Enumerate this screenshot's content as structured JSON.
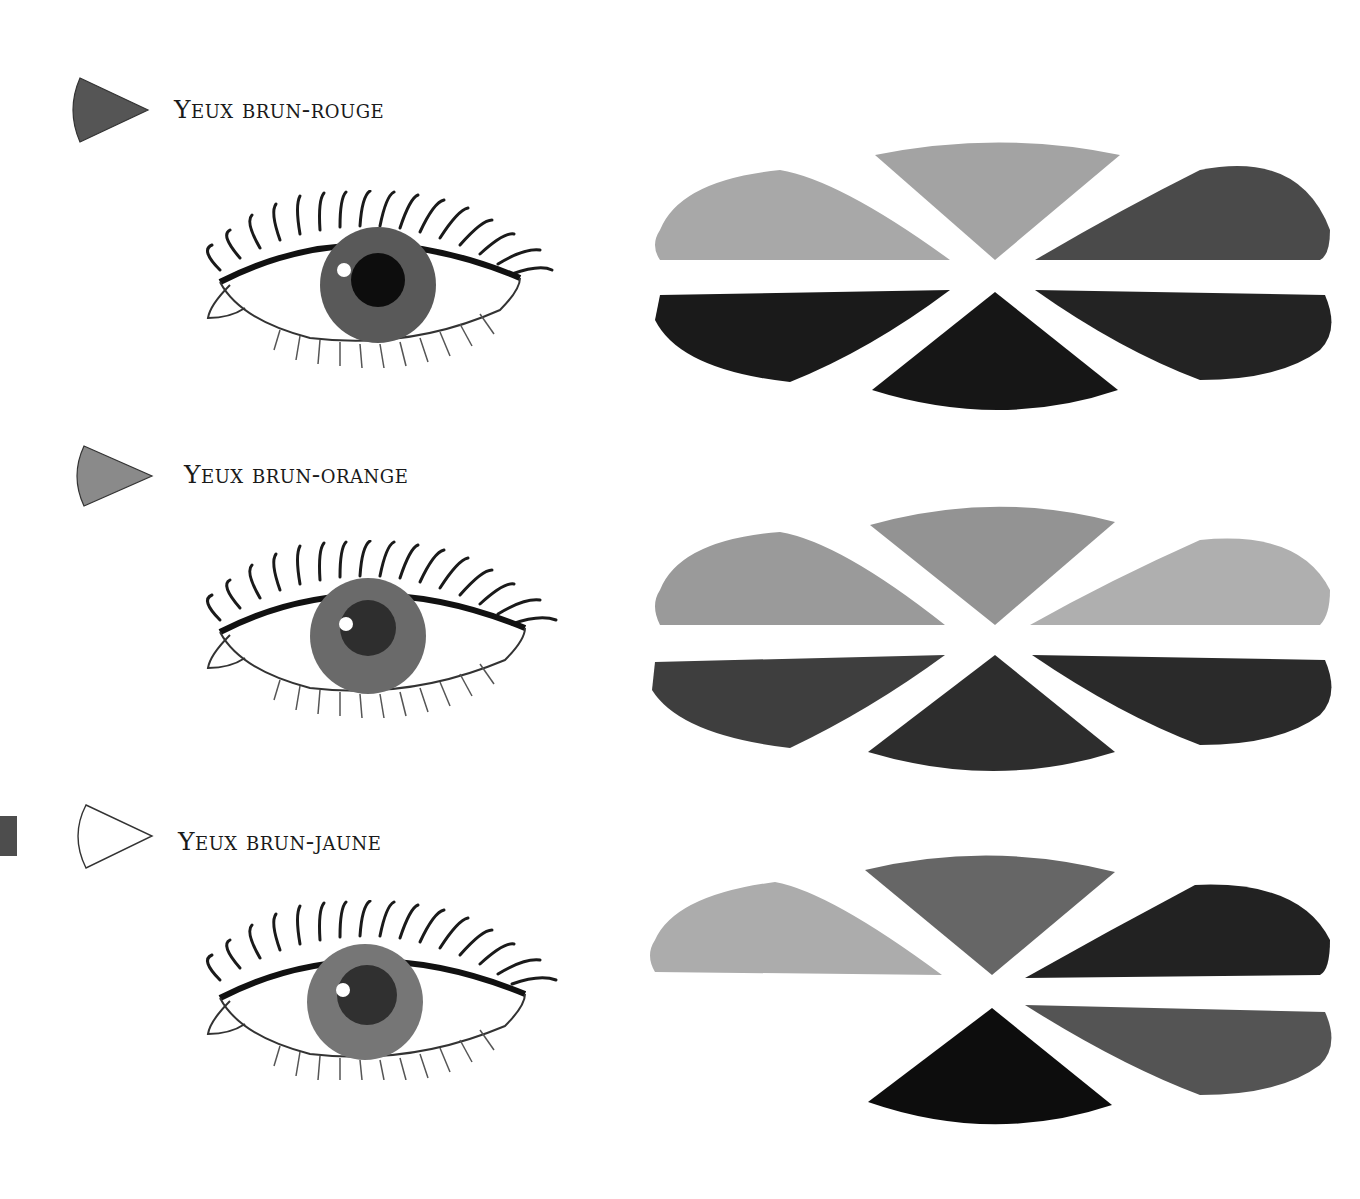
{
  "page": {
    "sections": [
      {
        "title": "Yeux brun-rouge",
        "marker_color": "#555555",
        "marker_icon": "wedge-marker-icon",
        "eye": {
          "iris": "#595959",
          "pupil": "#0d0d0d"
        },
        "palette": [
          {
            "position": "top-left",
            "color": "#a8a8a8"
          },
          {
            "position": "top-center",
            "color": "#a3a3a3"
          },
          {
            "position": "top-right",
            "color": "#4a4a4a"
          },
          {
            "position": "bottom-left",
            "color": "#1a1a1a"
          },
          {
            "position": "bottom-center",
            "color": "#161616"
          },
          {
            "position": "bottom-right",
            "color": "#232323"
          }
        ]
      },
      {
        "title": "Yeux brun-orange",
        "marker_color": "#8a8a8a",
        "marker_icon": "wedge-marker-icon",
        "eye": {
          "iris": "#6a6a6a",
          "pupil": "#2e2e2e"
        },
        "palette": [
          {
            "position": "top-left",
            "color": "#9a9a9a"
          },
          {
            "position": "top-center",
            "color": "#939393"
          },
          {
            "position": "top-right",
            "color": "#afafaf"
          },
          {
            "position": "bottom-left",
            "color": "#3e3e3e"
          },
          {
            "position": "bottom-center",
            "color": "#2d2d2d"
          },
          {
            "position": "bottom-right",
            "color": "#2a2a2a"
          }
        ]
      },
      {
        "title": "Yeux brun-jaune",
        "marker_color": "#ffffff",
        "marker_icon": "wedge-marker-outline-icon",
        "eye": {
          "iris": "#767676",
          "pupil": "#303030"
        },
        "palette": [
          {
            "position": "top-left",
            "color": "#acacac"
          },
          {
            "position": "top-center",
            "color": "#666666"
          },
          {
            "position": "top-right",
            "color": "#222222"
          },
          {
            "position": "bottom-center",
            "color": "#0d0d0d"
          },
          {
            "position": "bottom-right",
            "color": "#545454"
          }
        ]
      }
    ]
  }
}
